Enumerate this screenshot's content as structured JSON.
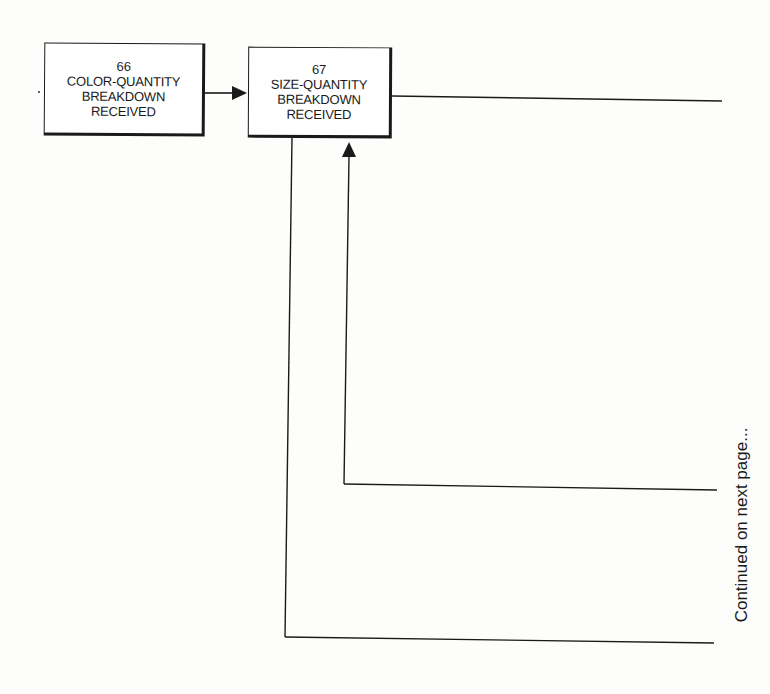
{
  "diagram": {
    "type": "flowchart",
    "nodes": [
      {
        "id": "66",
        "number": "66",
        "lines": [
          "COLOR-QUANTITY",
          "BREAKDOWN",
          "RECEIVED"
        ]
      },
      {
        "id": "67",
        "number": "67",
        "lines": [
          "SIZE-QUANTITY",
          "BREAKDOWN",
          "RECEIVED"
        ]
      }
    ],
    "edges": [
      {
        "from": "66",
        "to": "67",
        "arrow": true
      },
      {
        "from": "67",
        "to": "continued-top",
        "arrow": false
      },
      {
        "from": "continued-middle",
        "to": "67",
        "arrow": true
      },
      {
        "from": "67",
        "to": "continued-bottom",
        "arrow": false
      }
    ],
    "continuation_label": "Continued on next page...",
    "colors": {
      "ink": "#1a1a1a",
      "paper": "#fdfdfb"
    }
  }
}
